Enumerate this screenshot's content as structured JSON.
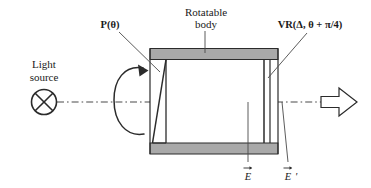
{
  "figure": {
    "title_text": "Polarimeter optical train schematic",
    "colors": {
      "line": "#2b2b2b",
      "body_fill": "#a9a9a9",
      "interior_fill": "#ffffff",
      "text": "#1a1a1a",
      "axis": "#555555"
    },
    "labels": {
      "light_source_line1": "Light",
      "light_source_line2": "source",
      "polarizer": "P(θ)",
      "rotatable_body_line1": "Rotatable",
      "rotatable_body_line2": "body",
      "variable_retarder": "VR(Δ, θ + π/4)",
      "field_in": "E",
      "field_out": "E",
      "field_out_prime": "'"
    },
    "icons": {
      "light_source": "crossed-circle-lamp-icon",
      "rotation": "circular-rotation-arrow-icon",
      "output_beam": "block-arrow-right-icon",
      "optical_axis": "dash-dot-axis-line"
    },
    "components": [
      {
        "name": "polarizer",
        "label": "P(θ)"
      },
      {
        "name": "rotatable-body",
        "label": "Rotatable body"
      },
      {
        "name": "variable-retarder",
        "label": "VR(Δ, θ + π/4)"
      },
      {
        "name": "input-field",
        "label": "E"
      },
      {
        "name": "output-field",
        "label": "E'"
      }
    ]
  }
}
